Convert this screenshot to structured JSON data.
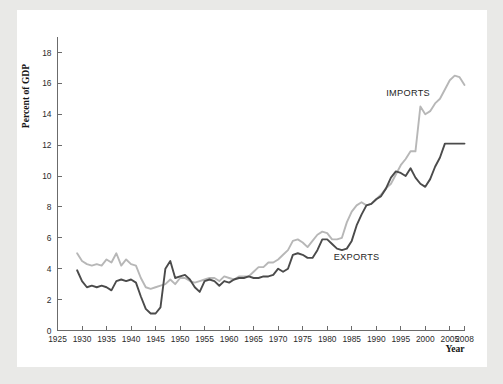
{
  "figure": {
    "background_color": "#e9e9e7",
    "panel_color": "#ffffff"
  },
  "chart_data": {
    "type": "line",
    "title": "",
    "xlabel": "Year",
    "ylabel": "Percent of GDP",
    "xlim": [
      1925,
      2008
    ],
    "ylim": [
      0,
      19
    ],
    "grid": false,
    "legend_position": "inline-annotations",
    "xticks": [
      1925,
      1930,
      1935,
      1940,
      1945,
      1950,
      1955,
      1960,
      1965,
      1970,
      1975,
      1980,
      1985,
      1990,
      1995,
      2000,
      2005,
      2008
    ],
    "xtick_labels": [
      "1925",
      "1930",
      "1935",
      "1940",
      "1945",
      "1950",
      "1955",
      "1960",
      "1965",
      "1970",
      "1975",
      "1980",
      "1985",
      "1990",
      "1995",
      "2000",
      "2005",
      "2008"
    ],
    "yticks": [
      0,
      2,
      4,
      6,
      8,
      10,
      12,
      14,
      16,
      18
    ],
    "ytick_labels": [
      "0",
      "2",
      "4",
      "6",
      "8",
      "10",
      "12",
      "14",
      "16",
      "18"
    ],
    "annotations": [
      {
        "text": "IMPORTS",
        "x": 1996.5,
        "y": 15.2
      },
      {
        "text": "EXPORTS",
        "x": 1986.0,
        "y": 4.55
      }
    ],
    "series": [
      {
        "name": "IMPORTS",
        "color": "#b7b7b7",
        "linewidth": 1.9,
        "x": [
          1929,
          1930,
          1931,
          1932,
          1933,
          1934,
          1935,
          1936,
          1937,
          1938,
          1939,
          1940,
          1941,
          1942,
          1943,
          1944,
          1945,
          1946,
          1947,
          1948,
          1949,
          1950,
          1951,
          1952,
          1953,
          1954,
          1955,
          1956,
          1957,
          1958,
          1959,
          1960,
          1961,
          1962,
          1963,
          1964,
          1965,
          1966,
          1967,
          1968,
          1969,
          1970,
          1971,
          1972,
          1973,
          1974,
          1975,
          1976,
          1977,
          1978,
          1979,
          1980,
          1981,
          1982,
          1983,
          1984,
          1985,
          1986,
          1987,
          1988,
          1989,
          1990,
          1991,
          1992,
          1993,
          1994,
          1995,
          1996,
          1997,
          1998,
          1999,
          2000,
          2001,
          2002,
          2003,
          2004,
          2005,
          2006,
          2007,
          2008
        ],
        "y": [
          5.0,
          4.5,
          4.3,
          4.2,
          4.3,
          4.2,
          4.6,
          4.4,
          5.0,
          4.2,
          4.6,
          4.3,
          4.2,
          3.4,
          2.8,
          2.7,
          2.8,
          2.9,
          3.0,
          3.3,
          3.0,
          3.4,
          3.4,
          3.2,
          3.1,
          3.2,
          3.3,
          3.4,
          3.4,
          3.2,
          3.5,
          3.4,
          3.3,
          3.5,
          3.5,
          3.5,
          3.8,
          4.1,
          4.1,
          4.4,
          4.4,
          4.6,
          4.9,
          5.2,
          5.8,
          5.9,
          5.7,
          5.4,
          5.8,
          6.2,
          6.4,
          6.3,
          5.9,
          5.9,
          6.0,
          7.0,
          7.7,
          8.1,
          8.3,
          8.1,
          8.2,
          8.5,
          8.8,
          9.2,
          9.5,
          10.1,
          10.7,
          11.1,
          11.6,
          11.6,
          14.5,
          14.0,
          14.2,
          14.7,
          15.0,
          15.6,
          16.2,
          16.5,
          16.4,
          15.9
        ]
      },
      {
        "name": "EXPORTS",
        "color": "#4b4b4b",
        "linewidth": 1.9,
        "x": [
          1929,
          1930,
          1931,
          1932,
          1933,
          1934,
          1935,
          1936,
          1937,
          1938,
          1939,
          1940,
          1941,
          1942,
          1943,
          1944,
          1945,
          1946,
          1947,
          1948,
          1949,
          1950,
          1951,
          1952,
          1953,
          1954,
          1955,
          1956,
          1957,
          1958,
          1959,
          1960,
          1961,
          1962,
          1963,
          1964,
          1965,
          1966,
          1967,
          1968,
          1969,
          1970,
          1971,
          1972,
          1973,
          1974,
          1975,
          1976,
          1977,
          1978,
          1979,
          1980,
          1981,
          1982,
          1983,
          1984,
          1985,
          1986,
          1987,
          1988,
          1989,
          1990,
          1991,
          1992,
          1993,
          1994,
          1995,
          1996,
          1997,
          1998,
          1999,
          2000,
          2001,
          2002,
          2003,
          2004,
          2005,
          2006,
          2007,
          2008
        ],
        "y": [
          3.9,
          3.2,
          2.8,
          2.9,
          2.8,
          2.9,
          2.8,
          2.6,
          3.2,
          3.3,
          3.2,
          3.3,
          3.1,
          2.2,
          1.4,
          1.1,
          1.1,
          1.5,
          4.0,
          4.5,
          3.4,
          3.5,
          3.6,
          3.3,
          2.8,
          2.5,
          3.2,
          3.3,
          3.2,
          2.9,
          3.2,
          3.1,
          3.3,
          3.4,
          3.4,
          3.5,
          3.4,
          3.4,
          3.5,
          3.5,
          3.6,
          4.0,
          3.8,
          4.0,
          4.9,
          5.0,
          4.9,
          4.7,
          4.7,
          5.2,
          5.9,
          5.9,
          5.6,
          5.3,
          5.2,
          5.3,
          5.8,
          6.8,
          7.5,
          8.1,
          8.2,
          8.5,
          8.7,
          9.2,
          9.9,
          10.3,
          10.2,
          10.0,
          10.5,
          9.9,
          9.5,
          9.3,
          9.8,
          10.6,
          11.2,
          12.1,
          12.1,
          12.1,
          12.1,
          12.1
        ]
      }
    ]
  }
}
